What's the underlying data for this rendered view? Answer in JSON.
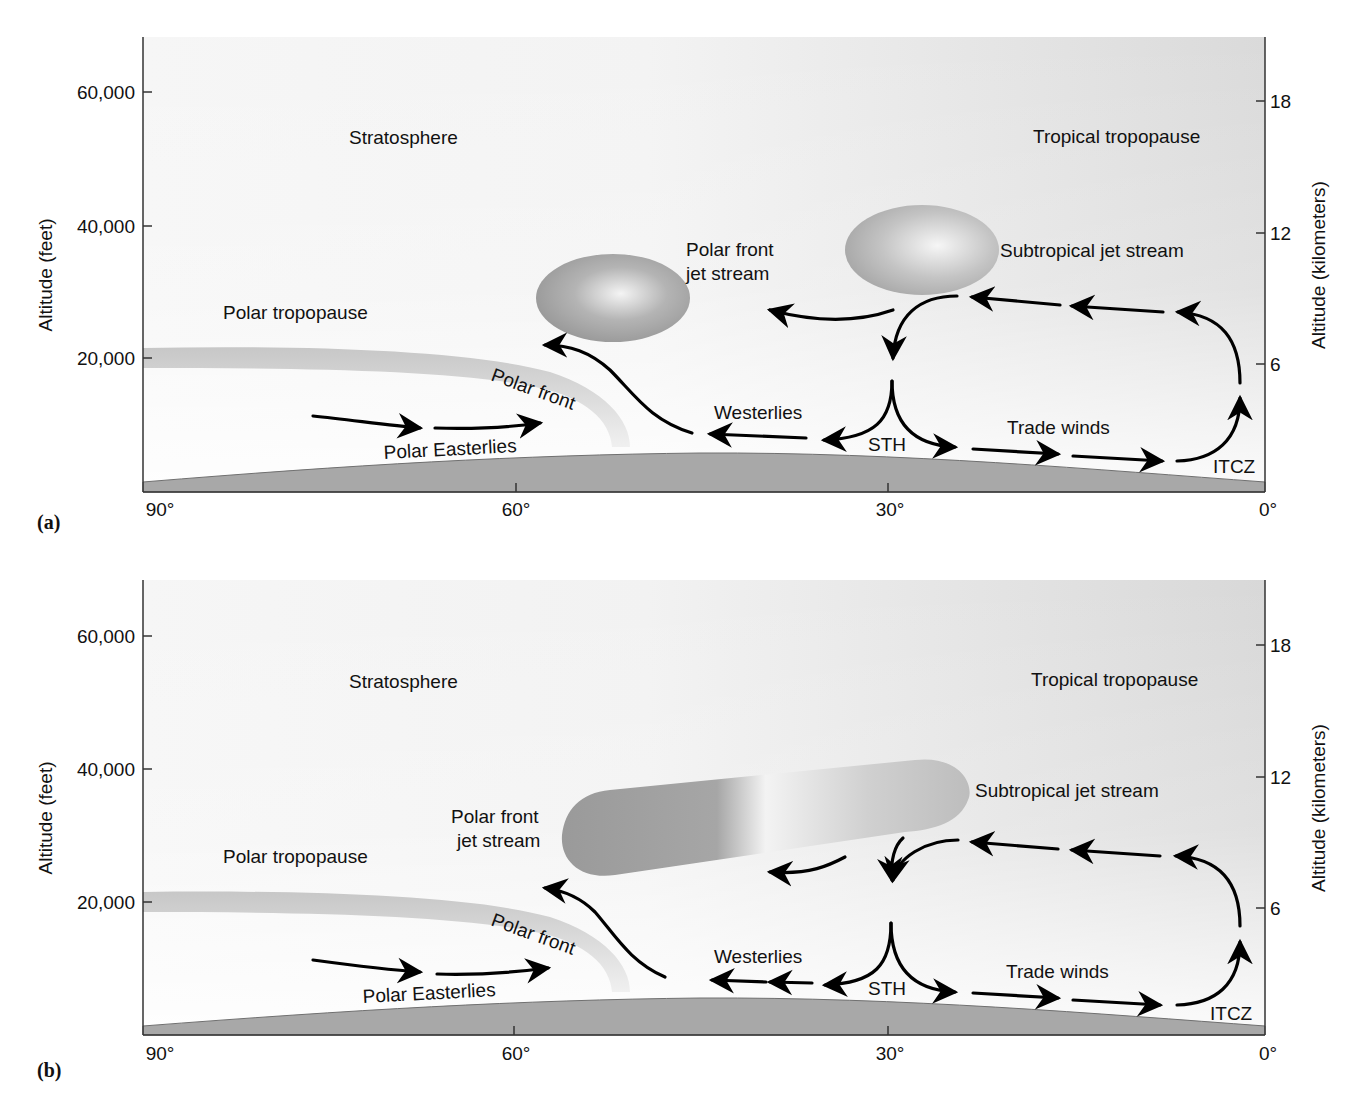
{
  "colors": {
    "background": "#ffffff",
    "sky_light": "#f4f4f4",
    "sky_shaded": "#dcdcdc",
    "ground": "#a9a9a9",
    "ground_edge": "#6f6f6f",
    "tropopause_band": "#cfcfcf",
    "jet_dark": "#9a9a9a",
    "jet_light": "#f2f2f2",
    "arrow": "#000000",
    "text": "#111111"
  },
  "axes": {
    "left_title": "Altitude (feet)",
    "left_ticks": [
      "60,000",
      "40,000",
      "20,000"
    ],
    "right_title": "Altitude (kilometers)",
    "right_ticks": [
      "18",
      "12",
      "6"
    ],
    "x_ticks": [
      "90°",
      "60°",
      "30°",
      "0°"
    ]
  },
  "panels": [
    {
      "tag": "(a)",
      "labels": {
        "stratosphere": "Stratosphere",
        "tropical_tropopause": "Tropical tropopause",
        "subtropical_jet": "Subtropical jet stream",
        "polar_front_jet_line1": "Polar front",
        "polar_front_jet_line2": "jet stream",
        "polar_tropopause": "Polar tropopause",
        "polar_front": "Polar front",
        "westerlies": "Westerlies",
        "polar_easterlies": "Polar Easterlies",
        "sth": "STH",
        "trade_winds": "Trade winds",
        "itcz": "ITCZ"
      }
    },
    {
      "tag": "(b)",
      "labels": {
        "stratosphere": "Stratosphere",
        "tropical_tropopause": "Tropical tropopause",
        "subtropical_jet": "Subtropical jet stream",
        "polar_front_jet_line1": "Polar front",
        "polar_front_jet_line2": "jet stream",
        "polar_tropopause": "Polar tropopause",
        "polar_front": "Polar front",
        "westerlies": "Westerlies",
        "polar_easterlies": "Polar Easterlies",
        "sth": "STH",
        "trade_winds": "Trade winds",
        "itcz": "ITCZ"
      }
    }
  ]
}
